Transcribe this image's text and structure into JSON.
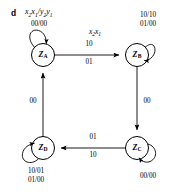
{
  "figure": {
    "panel_letter": "d",
    "legend_main": "x",
    "legend_sub1": "2",
    "legend_mid": "x",
    "legend_sub2": "1",
    "legend_slash": "/y",
    "legend_sub3": "2",
    "legend_tail": "y",
    "legend_sub4": "1",
    "legend_full": "x2x1/y2y1"
  },
  "states": [
    {
      "id": "A",
      "label_base": "Z",
      "label_sub": "A",
      "cx": 43,
      "cy": 55
    },
    {
      "id": "B",
      "label_base": "Z",
      "label_sub": "B",
      "cx": 137,
      "cy": 55
    },
    {
      "id": "C",
      "label_base": "Z",
      "label_sub": "C",
      "cx": 137,
      "cy": 148
    },
    {
      "id": "D",
      "label_base": "Z",
      "label_sub": "D",
      "cx": 43,
      "cy": 148
    }
  ],
  "self_loops": [
    {
      "state": "A",
      "labels": [
        "00/00"
      ],
      "position": "top-left"
    },
    {
      "state": "B",
      "labels": [
        "10/10",
        "01/00"
      ],
      "position": "top-right"
    },
    {
      "state": "C",
      "labels": [
        "00/00"
      ],
      "position": "bottom-right"
    },
    {
      "state": "D",
      "labels": [
        "10/01",
        "01/00"
      ],
      "position": "bottom-left"
    }
  ],
  "transitions": [
    {
      "from": "A",
      "to": "B",
      "header": "x2x1",
      "label_above": "10",
      "label_below": "01"
    },
    {
      "from": "B",
      "to": "C",
      "label": "00"
    },
    {
      "from": "C",
      "to": "D",
      "label_above": "01",
      "label_below": "10"
    },
    {
      "from": "D",
      "to": "A",
      "label": "00"
    }
  ],
  "edge_labels": {
    "ab_header_x": "x",
    "ab_header_sub2": "2",
    "ab_header_x1": "x",
    "ab_header_sub1": "1",
    "ab_above": "10",
    "ab_below": "01",
    "bc": "00",
    "cd_above": "01",
    "cd_below": "10",
    "da": "00",
    "loop_a": "00/00",
    "loop_b_line1": "10/10",
    "loop_b_line2": "01/00",
    "loop_c": "00/00",
    "loop_d_line1": "10/01",
    "loop_d_line2": "01/00"
  },
  "colors": {
    "stroke": "#000000",
    "background": "#ffffff",
    "text": "#000000"
  }
}
